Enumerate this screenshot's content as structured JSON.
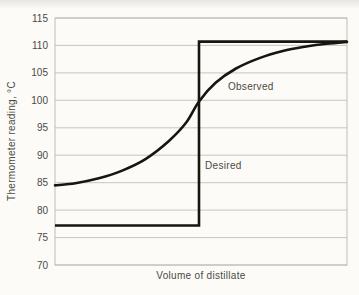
{
  "figure": {
    "kind": "scanned-textbook-figure"
  },
  "colors": {
    "background": "#fcfbf7",
    "grid": "#bcb7ad",
    "curve": "#17150f",
    "text": "#4b4a44"
  },
  "chart_data": {
    "type": "line",
    "title": "",
    "xlabel": "Volume of distillate",
    "ylabel": "Thermometer reading, °C",
    "ylim": [
      70,
      115
    ],
    "yticks": [
      115,
      110,
      105,
      100,
      95,
      90,
      85,
      80,
      75,
      70
    ],
    "xticks": [],
    "grid": "horizontal",
    "legend_position": "none",
    "series": [
      {
        "name": "Observed",
        "style": "smooth",
        "x_frac": [
          0.0,
          0.07,
          0.15,
          0.23,
          0.31,
          0.39,
          0.45,
          0.493,
          0.55,
          0.62,
          0.7,
          0.78,
          0.86,
          0.93,
          1.0
        ],
        "y": [
          84.5,
          84.9,
          85.8,
          87.2,
          89.3,
          92.6,
          96.0,
          99.8,
          103.2,
          105.8,
          107.7,
          109.0,
          109.8,
          110.3,
          110.65
        ]
      },
      {
        "name": "Desired",
        "style": "step",
        "lower_temp": 77.2,
        "upper_temp": 110.7,
        "step_x_frac": 0.493
      }
    ],
    "annotations": [
      {
        "text": "Observed",
        "x_frac": 0.592,
        "temp": 102.6
      },
      {
        "text": "Desired",
        "x_frac": 0.514,
        "temp": 88.2
      }
    ]
  }
}
